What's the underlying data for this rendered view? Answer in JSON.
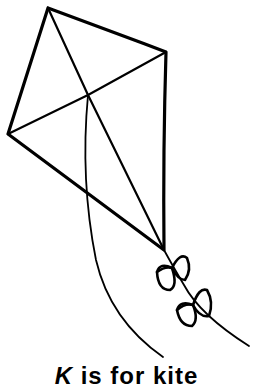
{
  "caption": {
    "letter": "K",
    "rest": " is for kite"
  },
  "illustration": {
    "subject": "kite",
    "parts": [
      "kite-frame",
      "cross-spars",
      "string",
      "tail-with-bows"
    ],
    "stroke_color": "#000000",
    "background_color": "#ffffff"
  }
}
